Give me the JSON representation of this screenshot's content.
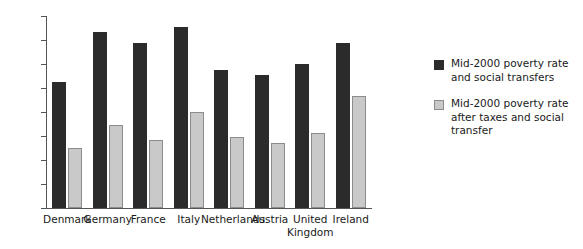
{
  "chart_data": {
    "type": "bar",
    "title": "",
    "subtitle": "",
    "xlabel": "",
    "ylabel": "",
    "ylim": [
      0,
      40
    ],
    "ytick_step": 5,
    "yticks": [
      "40",
      "35",
      "30",
      "25",
      "20",
      "15",
      "10",
      "5",
      "0"
    ],
    "grid": false,
    "legend_position": "right",
    "categories": [
      "Denmark",
      "Germany",
      "France",
      "Italy",
      "Netherlands",
      "Austria",
      "United Kingdom",
      "Ireland"
    ],
    "series": [
      {
        "name": "Mid-2000 poverty rate and social transfers",
        "color": "#2b2b2b",
        "values": [
          26.2,
          36.6,
          34.3,
          37.7,
          28.7,
          27.7,
          30.0,
          34.4
        ]
      },
      {
        "name": "Mid-2000 poverty rate after taxes and social transfer",
        "color": "#c9c9c9",
        "values": [
          12.5,
          17.3,
          14.2,
          20.1,
          14.8,
          13.5,
          15.6,
          23.3
        ]
      }
    ]
  },
  "legend": {
    "entries": [
      {
        "label": "Mid-2000 poverty rate and social transfers",
        "swatch": "dark"
      },
      {
        "label": "Mid-2000 poverty rate after taxes and social transfer",
        "swatch": "light"
      }
    ]
  },
  "colors": {
    "series_dark": "#2b2b2b",
    "series_light": "#c9c9c9",
    "series_light_border": "#8c8c8c",
    "axis": "#555555",
    "text": "#1a1a1a",
    "background": "#ffffff"
  }
}
